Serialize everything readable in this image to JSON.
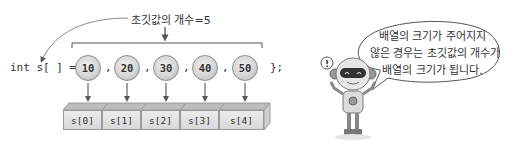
{
  "diagram": {
    "count_label": "초깃값의 개수=5",
    "code": {
      "prefix": "int s[ ] = {",
      "suffix": "};",
      "separator": ","
    },
    "values": [
      "10",
      "20",
      "30",
      "40",
      "50"
    ],
    "cells": [
      "s[0]",
      "s[1]",
      "s[2]",
      "s[3]",
      "s[4]"
    ],
    "speech_bubble": {
      "lines": [
        "배열의 크기가 주어지지",
        "않은 경우는 초깃값의 개수가",
        "배열의 크기가 됩니다."
      ]
    },
    "colors": {
      "line": "#555555",
      "circle_fill": "#d6d6d6",
      "cell_fill": "#e2e2e2",
      "text": "#333333"
    }
  }
}
